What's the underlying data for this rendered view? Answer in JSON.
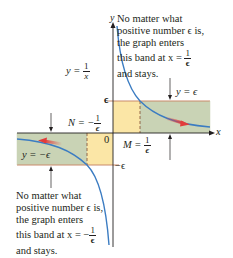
{
  "figure": {
    "curve_label": {
      "lhs": "y = ",
      "num": "1",
      "den": "x"
    },
    "band_top_label": "y = ϵ",
    "band_bottom_label": "y = −ϵ",
    "eps_tick": "ϵ",
    "neg_eps_tick": "−ϵ",
    "origin_label": "0",
    "x_axis_label": "x",
    "y_axis_label": "y",
    "M_label": {
      "lhs": "M = ",
      "num": "1",
      "den": "ϵ"
    },
    "N_label": {
      "lhs": "N = −",
      "num": "1",
      "den": "ϵ"
    },
    "right_note": {
      "lines": [
        "No matter what",
        "positive number ϵ is,",
        "the graph enters",
        "this band at x = ",
        "and stays."
      ],
      "frac_num": "1",
      "frac_den": "ϵ"
    },
    "left_note": {
      "lines": [
        "No matter what",
        "positive number ϵ is,",
        "the graph enters",
        "this band at x = −",
        "and stays."
      ],
      "frac_num": "1",
      "frac_den": "ϵ"
    },
    "colors": {
      "band_green": "#c9d3b5",
      "band_yellow": "#fbe6a6",
      "band_edge": "#c98a6a",
      "curve": "#3b7cc2",
      "arrow_red": "#e23b3b",
      "axis": "#231f20",
      "dashed": "#8a5a3c"
    }
  }
}
